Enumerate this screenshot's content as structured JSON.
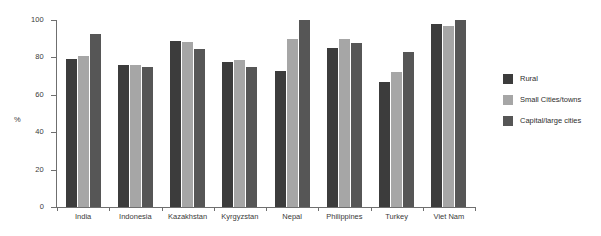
{
  "chart_data": {
    "type": "bar",
    "title": "",
    "subtitle": "",
    "xlabel": "",
    "ylabel": "%",
    "ylim": [
      0,
      100
    ],
    "yticks": [
      0,
      20,
      40,
      60,
      80,
      100
    ],
    "grid": false,
    "legend_position": "right",
    "categories": [
      "India",
      "Indonesia",
      "Kazakhstan",
      "Kyrgyzstan",
      "Nepal",
      "Philippines",
      "Turkey",
      "Viet Nam"
    ],
    "series": [
      {
        "name": "Rural",
        "color": "#3c3c3c",
        "values": [
          79,
          76,
          89,
          77.5,
          73,
          85,
          67,
          98
        ]
      },
      {
        "name": "Small Cities/towns",
        "color": "#a6a6a6",
        "values": [
          80.5,
          76,
          88.5,
          78.5,
          90,
          90,
          72,
          97
        ]
      },
      {
        "name": "Capital/large cities",
        "color": "#565656",
        "values": [
          92.5,
          75,
          84.5,
          75,
          100,
          87.5,
          83,
          100
        ]
      }
    ]
  },
  "axis": {
    "y_title": "%",
    "y_tick_labels": [
      "100",
      "80",
      "60",
      "40",
      "20",
      "0"
    ]
  },
  "legend": {
    "items": [
      {
        "label": "Rural",
        "color": "#3c3c3c"
      },
      {
        "label": "Small Cities/towns",
        "color": "#a6a6a6"
      },
      {
        "label": "Capital/large cities",
        "color": "#565656"
      }
    ]
  }
}
